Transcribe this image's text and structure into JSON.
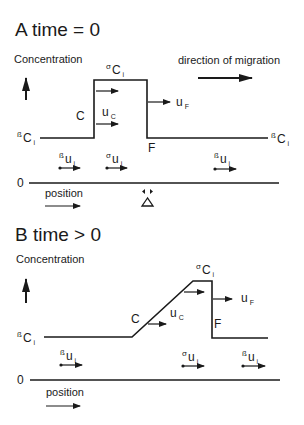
{
  "panel_a": {
    "title": "A  time = 0",
    "y_axis_label": "Concentration",
    "direction_label": "direction of migration",
    "x_axis_label": "position",
    "zero_label": "0",
    "labels": {
      "alpha_ci": {
        "sup": "σ",
        "main": "C",
        "sub": "i"
      },
      "beta_ci_left": {
        "sup": "ß",
        "main": "C",
        "sub": "i"
      },
      "beta_ci_right": {
        "sup": "ß",
        "main": "C",
        "sub": "i"
      },
      "c": "C",
      "f": "F",
      "uc": {
        "main": "u",
        "sub": "C"
      },
      "uf": {
        "main": "u",
        "sub": "F"
      },
      "beta_ui_left": {
        "sup": "ß",
        "main": "u",
        "sub": "i"
      },
      "alpha_ui": {
        "sup": "σ",
        "main": "u",
        "sub": "i"
      },
      "beta_ui_right": {
        "sup": "ß",
        "main": "u",
        "sub": "i"
      }
    }
  },
  "panel_b": {
    "title": "B  time > 0",
    "y_axis_label": "Concentration",
    "x_axis_label": "position",
    "zero_label": "0",
    "labels": {
      "alpha_ci": {
        "sup": "σ",
        "main": "C",
        "sub": "i"
      },
      "beta_ci_left": {
        "sup": "ß",
        "main": "C",
        "sub": "i"
      },
      "c": "C",
      "f": "F",
      "uc": {
        "main": "u",
        "sub": "C"
      },
      "uf": {
        "main": "u",
        "sub": "F"
      },
      "beta_ui_left": {
        "sup": "ß",
        "main": "u",
        "sub": "i"
      },
      "alpha_ui": {
        "sup": "σ",
        "main": "u",
        "sub": "i"
      },
      "beta_ui_right": {
        "sup": "ß",
        "main": "u",
        "sub": "i"
      }
    }
  },
  "colors": {
    "ink": "#1a1a1a",
    "background": "#ffffff"
  }
}
